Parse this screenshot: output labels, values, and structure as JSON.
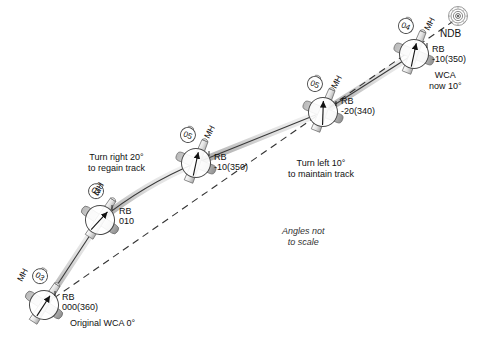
{
  "figure": {
    "type": "ndb-homing-tracking-diagram",
    "note_italic_line1": "Angles not",
    "note_italic_line2": "to scale",
    "ndb_label": "NDB",
    "ndb_icon": "ndb-beacon-icon",
    "desired_track_style": "dashed",
    "colors": {
      "line": "#333333",
      "track_bar_light": "#e6e6e6",
      "track_bar_dark": "#9a9a9a",
      "dashed": "#333333",
      "text": "#111111",
      "aircraft_fill": "#ffffff",
      "aircraft_stroke": "#555555",
      "wing_shadow": "#b5b5b5"
    }
  },
  "aircraft": [
    {
      "id": "ac1",
      "mh_label": "MH",
      "mh_value": "03",
      "rb_label": "RB",
      "rb_value": "000(360)",
      "caption": "Original WCA 0°",
      "needle_deg": 0
    },
    {
      "id": "ac2",
      "mh_label": "MH",
      "mh_value": "03",
      "rb_label": "RB",
      "rb_value": "010",
      "caption": "",
      "needle_deg": 10
    },
    {
      "id": "ac3",
      "mh_label": "MH",
      "mh_value": "05",
      "rb_label": "RB",
      "rb_value": "-10(350)",
      "caption": "",
      "needle_deg": -10
    },
    {
      "id": "ac4",
      "mh_label": "MH",
      "mh_value": "05",
      "rb_label": "RB",
      "rb_value": "-20(340)",
      "caption": "",
      "needle_deg": -20
    },
    {
      "id": "ac5",
      "mh_label": "MH",
      "mh_value": "04",
      "rb_label": "RB",
      "rb_value": "-10(350)",
      "caption_line1": "WCA",
      "caption_line2": "now 10°",
      "needle_deg": -10
    }
  ],
  "annotations": [
    {
      "id": "turn-right",
      "line1": "Turn right 20°",
      "line2": "to regain track"
    },
    {
      "id": "turn-left",
      "line1": "Turn left 10°",
      "line2": "to maintain track"
    }
  ]
}
